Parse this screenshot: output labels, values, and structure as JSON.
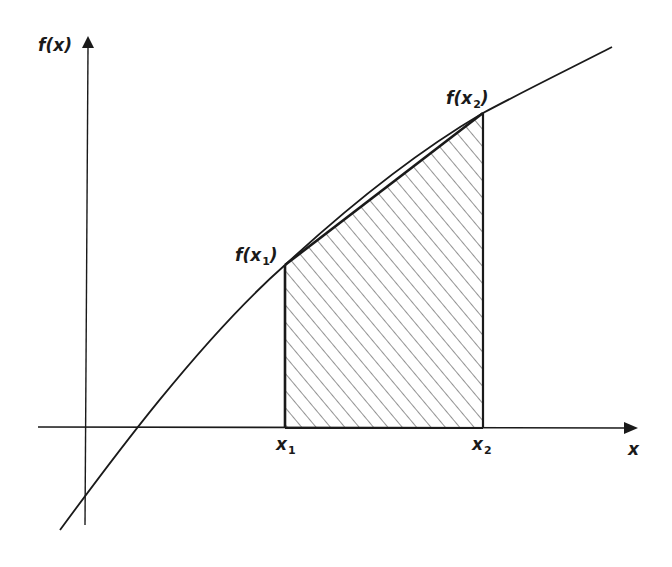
{
  "diagram": {
    "type": "area-under-curve-trapezoid",
    "colors": {
      "stroke": "#1a1a1a",
      "hatch": "#3a3a3a",
      "background": "#ffffff"
    },
    "axes": {
      "y_label": "f(x)",
      "x_label": "x"
    },
    "points": {
      "x1": {
        "label_var": "x",
        "label_sub": "1"
      },
      "x2": {
        "label_var": "x",
        "label_sub": "2"
      },
      "fx1": {
        "label_pre": "f(",
        "label_var": "x",
        "label_sub": "1",
        "label_post": ")"
      },
      "fx2": {
        "label_pre": "f(",
        "label_var": "x",
        "label_sub": "2",
        "label_post": ")"
      }
    },
    "shaded_region": "trapezoid between x1 and x2 under chord from f(x1) to f(x2)",
    "curve": "concave increasing function crossing x-axis right of origin"
  }
}
